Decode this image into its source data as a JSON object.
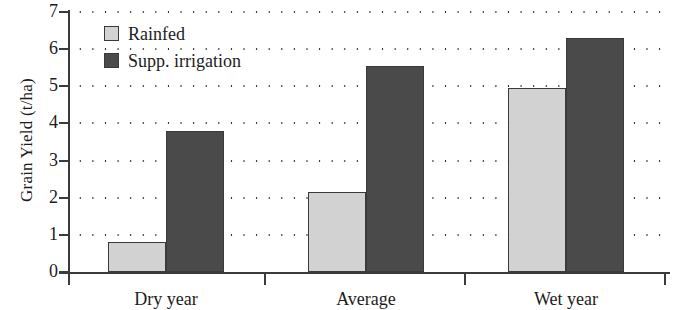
{
  "chart_data": {
    "type": "bar",
    "title": "",
    "xlabel": "",
    "ylabel": "Grain Yield (t/ha)",
    "categories": [
      "Dry year",
      "Average",
      "Wet year"
    ],
    "series": [
      {
        "name": "Rainfed",
        "color": "#d2d2d2",
        "values": [
          0.8,
          2.15,
          4.95
        ]
      },
      {
        "name": "Supp. irrigation",
        "color": "#4a4a4a",
        "values": [
          3.8,
          5.55,
          6.3
        ]
      }
    ],
    "ylim": [
      0,
      7
    ],
    "yticks": [
      0,
      1,
      2,
      3,
      4,
      5,
      6,
      7
    ],
    "ytick_labels": [
      "0",
      "1",
      "2",
      "3",
      "4",
      "5",
      "6",
      "7"
    ],
    "grid": "horizontal-dotted",
    "legend_position": "top-left"
  },
  "legend": {
    "items": [
      {
        "label": "Rainfed",
        "swatch": "light-gray-square"
      },
      {
        "label": "Supp. irrigation",
        "swatch": "dark-gray-square"
      }
    ]
  }
}
